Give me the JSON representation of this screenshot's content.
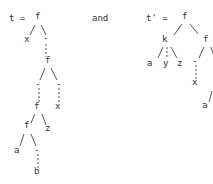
{
  "left_tree": {
    "label": "t =",
    "nodes": [
      {
        "id": "f1",
        "text": "f",
        "x": 37,
        "y": 16
      },
      {
        "id": "x1",
        "text": "x",
        "x": 26,
        "y": 39
      },
      {
        "id": "h1",
        "text": "-",
        "x": 45,
        "y": 38
      },
      {
        "id": "f2",
        "text": "f",
        "x": 47,
        "y": 60
      },
      {
        "id": "h2",
        "text": "-",
        "x": 37,
        "y": 84
      },
      {
        "id": "h3",
        "text": "-",
        "x": 58,
        "y": 84
      },
      {
        "id": "x2",
        "text": "x",
        "x": 57,
        "y": 106
      },
      {
        "id": "f3",
        "text": "f",
        "x": 36,
        "y": 106
      },
      {
        "id": "z1",
        "text": "z",
        "x": 47,
        "y": 128
      },
      {
        "id": "f4",
        "text": "f",
        "x": 26,
        "y": 125
      },
      {
        "id": "a1",
        "text": "a",
        "x": 16,
        "y": 150
      },
      {
        "id": "h4",
        "text": "-",
        "x": 36,
        "y": 150
      },
      {
        "id": "b1",
        "text": "b",
        "x": 36,
        "y": 171
      }
    ]
  },
  "connector": "and",
  "right_tree": {
    "label": "t' =",
    "nodes": [
      {
        "id": "rf1",
        "text": "f",
        "x": 184,
        "y": 16
      },
      {
        "id": "k",
        "text": "k",
        "x": 164,
        "y": 39
      },
      {
        "id": "ra",
        "text": "a",
        "x": 149,
        "y": 63
      },
      {
        "id": "ry",
        "text": "y",
        "x": 165,
        "y": 63
      },
      {
        "id": "rz",
        "text": "z",
        "x": 179,
        "y": 63
      },
      {
        "id": "rf2",
        "text": "f",
        "x": 205,
        "y": 39
      },
      {
        "id": "rh1",
        "text": "-",
        "x": 194,
        "y": 61
      },
      {
        "id": "rx",
        "text": "x",
        "x": 194,
        "y": 82
      },
      {
        "id": "ra2",
        "text": "a",
        "x": 204,
        "y": 105
      }
    ]
  }
}
